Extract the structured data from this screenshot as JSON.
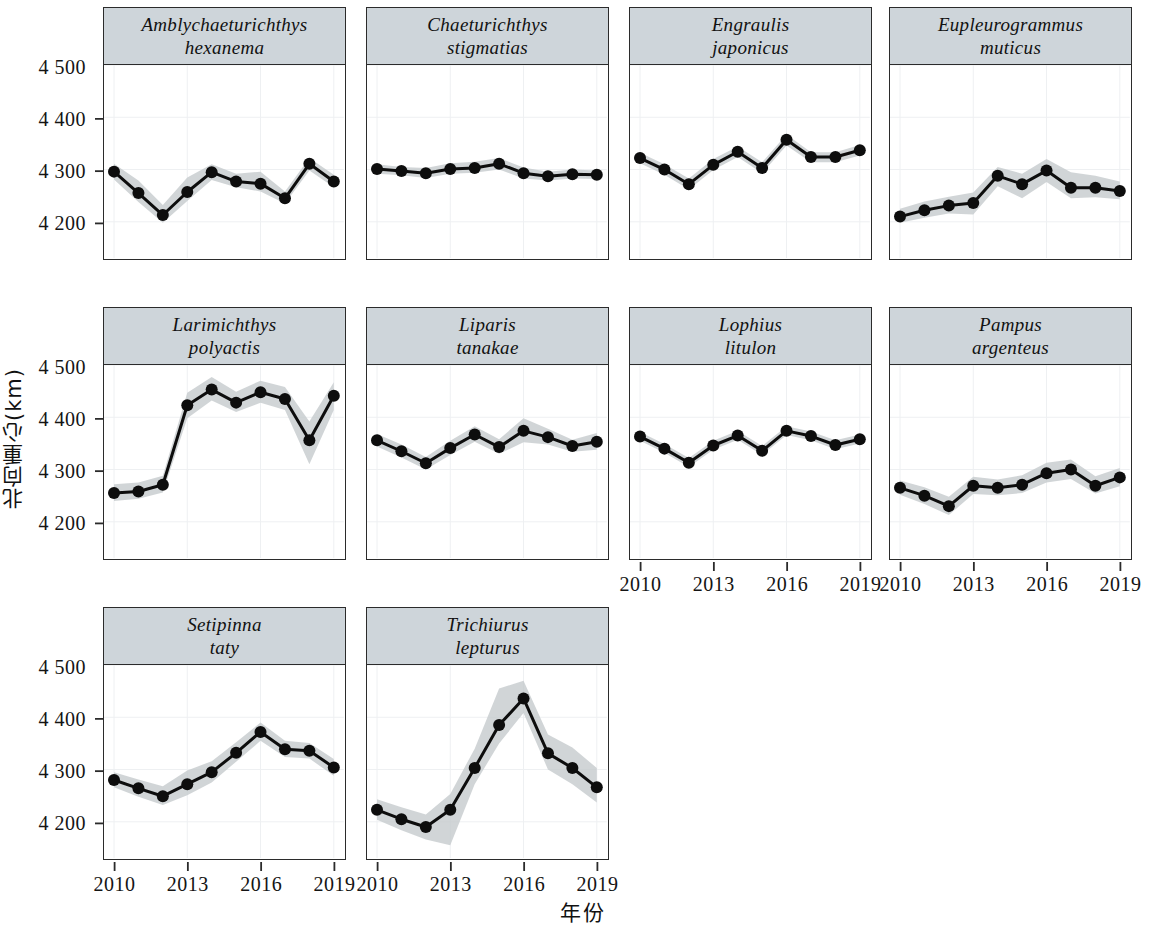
{
  "figure": {
    "y_axis_title": "北向重心(km)",
    "x_axis_title": "年份"
  },
  "chart_data": {
    "type": "line",
    "title": "",
    "xlabel": "年份",
    "ylabel": "北向重心(km)",
    "grid": true,
    "legend": "none",
    "xlim": [
      2010,
      2019
    ],
    "ylim": [
      4130,
      4500
    ],
    "xticks": [
      2010,
      2013,
      2016,
      2019
    ],
    "xticklabels": [
      "2010",
      "2013",
      "2016",
      "2019"
    ],
    "yticks": [
      4200,
      4300,
      4400,
      4500
    ],
    "yticklabels": [
      "4 200",
      "4 300",
      "4 400",
      "4 500"
    ],
    "x": [
      2010,
      2011,
      2012,
      2013,
      2014,
      2015,
      2016,
      2017,
      2018,
      2019
    ],
    "panel_layout": [
      4,
      4,
      2
    ],
    "band_description": "grey ribbon = confidence interval around the mean northward centre of gravity",
    "panels": [
      {
        "name": "Amblychaeturichthys hexanema",
        "title_lines": [
          "Amblychaeturichthys",
          "hexanema"
        ],
        "values": [
          4296,
          4255,
          4213,
          4257,
          4295,
          4277,
          4273,
          4245,
          4311,
          4277
        ],
        "lower": [
          4281,
          4238,
          4198,
          4240,
          4280,
          4266,
          4258,
          4235,
          4298,
          4266
        ],
        "upper": [
          4311,
          4279,
          4232,
          4285,
          4310,
          4292,
          4296,
          4258,
          4322,
          4290
        ]
      },
      {
        "name": "Chaeturichthys stigmatias",
        "title_lines": [
          "Chaeturichthys",
          "stigmatias"
        ],
        "values": [
          4301,
          4297,
          4293,
          4301,
          4303,
          4311,
          4293,
          4287,
          4291,
          4290
        ],
        "lower": [
          4292,
          4289,
          4284,
          4292,
          4294,
          4300,
          4283,
          4279,
          4283,
          4282
        ],
        "upper": [
          4310,
          4305,
          4303,
          4312,
          4315,
          4322,
          4304,
          4296,
          4300,
          4298
        ]
      },
      {
        "name": "Engraulis japonicus",
        "title_lines": [
          "Engraulis",
          "japonicus"
        ],
        "values": [
          4322,
          4300,
          4272,
          4309,
          4334,
          4303,
          4357,
          4324,
          4324,
          4337
        ],
        "lower": [
          4312,
          4290,
          4262,
          4299,
          4324,
          4293,
          4346,
          4314,
          4314,
          4327
        ],
        "upper": [
          4332,
          4310,
          4283,
          4320,
          4344,
          4314,
          4367,
          4333,
          4333,
          4347
        ]
      },
      {
        "name": "Eupleurogrammus muticus",
        "title_lines": [
          "Eupleurogrammus",
          "muticus"
        ],
        "values": [
          4210,
          4222,
          4231,
          4236,
          4288,
          4272,
          4298,
          4265,
          4265,
          4259
        ],
        "lower": [
          4198,
          4208,
          4216,
          4214,
          4268,
          4245,
          4276,
          4245,
          4247,
          4243
        ],
        "upper": [
          4225,
          4239,
          4248,
          4256,
          4305,
          4292,
          4320,
          4295,
          4288,
          4277
        ]
      },
      {
        "name": "Larimichthys polyactis",
        "title_lines": [
          "Larimichthys",
          "polyactis"
        ],
        "values": [
          4255,
          4258,
          4271,
          4423,
          4453,
          4428,
          4448,
          4435,
          4356,
          4441
        ],
        "lower": [
          4240,
          4244,
          4256,
          4398,
          4432,
          4410,
          4428,
          4414,
          4310,
          4414
        ],
        "upper": [
          4272,
          4275,
          4288,
          4447,
          4477,
          4449,
          4470,
          4458,
          4392,
          4467
        ]
      },
      {
        "name": "Liparis tanakae",
        "title_lines": [
          "Liparis",
          "tanakae"
        ],
        "values": [
          4356,
          4335,
          4312,
          4341,
          4367,
          4343,
          4374,
          4362,
          4345,
          4353
        ],
        "lower": [
          4344,
          4323,
          4300,
          4328,
          4353,
          4330,
          4352,
          4348,
          4334,
          4338
        ],
        "upper": [
          4368,
          4348,
          4324,
          4355,
          4383,
          4358,
          4398,
          4378,
          4357,
          4370
        ]
      },
      {
        "name": "Lophius litulon",
        "title_lines": [
          "Lophius",
          "litulon"
        ],
        "values": [
          4363,
          4340,
          4313,
          4346,
          4365,
          4336,
          4374,
          4364,
          4347,
          4358
        ],
        "lower": [
          4355,
          4332,
          4305,
          4338,
          4357,
          4328,
          4366,
          4356,
          4339,
          4350
        ],
        "upper": [
          4372,
          4349,
          4322,
          4355,
          4374,
          4345,
          4383,
          4373,
          4356,
          4367
        ]
      },
      {
        "name": "Pampus argenteus",
        "title_lines": [
          "Pampus",
          "argenteus"
        ],
        "values": [
          4265,
          4250,
          4230,
          4269,
          4265,
          4271,
          4293,
          4300,
          4269,
          4285
        ],
        "lower": [
          4252,
          4234,
          4213,
          4253,
          4251,
          4255,
          4275,
          4282,
          4254,
          4268
        ],
        "upper": [
          4279,
          4266,
          4248,
          4286,
          4281,
          4289,
          4313,
          4319,
          4287,
          4303
        ]
      },
      {
        "name": "Setipinna taty",
        "title_lines": [
          "Setipinna",
          "taty"
        ],
        "values": [
          4280,
          4264,
          4249,
          4272,
          4295,
          4332,
          4372,
          4339,
          4336,
          4304
        ],
        "lower": [
          4266,
          4248,
          4232,
          4251,
          4275,
          4315,
          4355,
          4324,
          4321,
          4288
        ],
        "upper": [
          4295,
          4281,
          4268,
          4298,
          4316,
          4352,
          4390,
          4355,
          4351,
          4320
        ]
      },
      {
        "name": "Trichiurus lepturus",
        "title_lines": [
          "Trichiurus",
          "lepturus"
        ],
        "values": [
          4223,
          4205,
          4190,
          4223,
          4303,
          4385,
          4436,
          4331,
          4303,
          4266
        ],
        "lower": [
          4204,
          4184,
          4166,
          4155,
          4272,
          4350,
          4408,
          4300,
          4272,
          4237
        ],
        "upper": [
          4243,
          4228,
          4214,
          4253,
          4340,
          4455,
          4470,
          4367,
          4342,
          4303
        ]
      }
    ]
  }
}
